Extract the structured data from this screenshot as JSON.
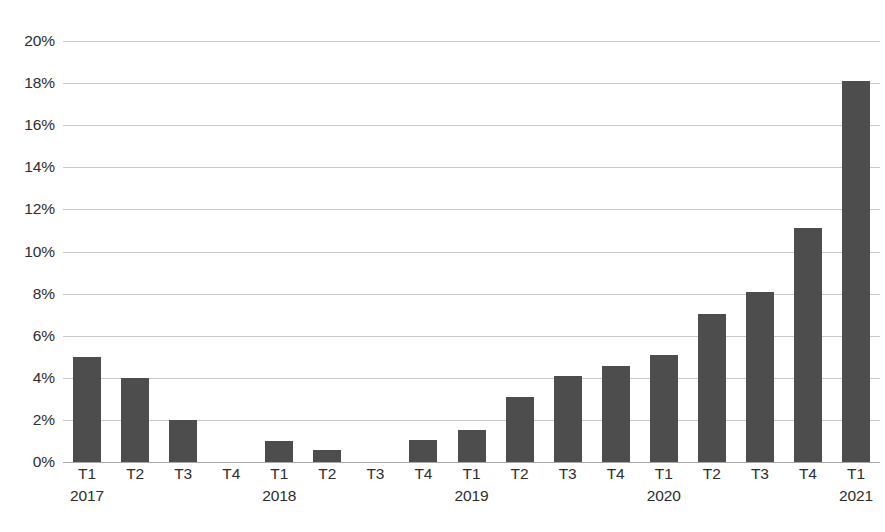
{
  "chart_data": {
    "type": "bar",
    "title": "",
    "xlabel": "",
    "ylabel": "",
    "ylim": [
      0,
      20
    ],
    "ytick_step": 2,
    "grid": true,
    "legend": "none",
    "bar_color": "#4d4d4d",
    "gridline_color": "#c9c9c9",
    "axis_color": "#a8a8a8",
    "value_suffix": "%",
    "categories": [
      "T1",
      "T2",
      "T3",
      "T4",
      "T1",
      "T2",
      "T3",
      "T4",
      "T1",
      "T2",
      "T3",
      "T4",
      "T1",
      "T2",
      "T3",
      "T4",
      "T1"
    ],
    "year_labels": [
      "2017",
      "",
      "",
      "",
      "2018",
      "",
      "",
      "",
      "2019",
      "",
      "",
      "",
      "2020",
      "",
      "",
      "",
      "2021"
    ],
    "values": [
      5.0,
      4.0,
      2.0,
      0,
      1.0,
      0.55,
      0,
      1.05,
      1.5,
      3.1,
      4.1,
      4.55,
      5.1,
      7.05,
      8.1,
      11.1,
      18.1
    ],
    "ytick_labels": [
      "20%",
      "18%",
      "16%",
      "14%",
      "12%",
      "10%",
      "8%",
      "6%",
      "4%",
      "2%",
      "0%"
    ],
    "ytick_values": [
      20,
      18,
      16,
      14,
      12,
      10,
      8,
      6,
      4,
      2,
      0
    ]
  }
}
